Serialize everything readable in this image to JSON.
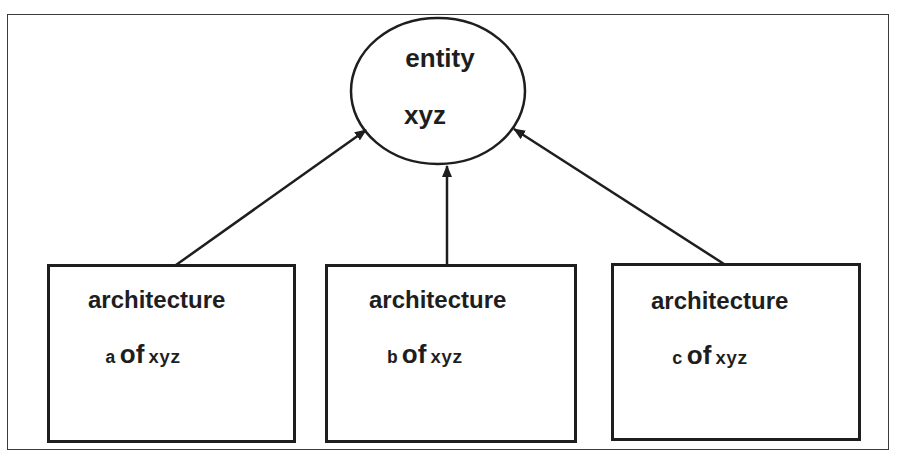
{
  "diagram": {
    "entity": {
      "title": "entity",
      "subtitle": "xyz"
    },
    "architectures": [
      {
        "title": "architecture",
        "letter": "a",
        "of": "of",
        "target": "xyz"
      },
      {
        "title": "architecture",
        "letter": "b",
        "of": "of",
        "target": "xyz"
      },
      {
        "title": "architecture",
        "letter": "c",
        "of": "of",
        "target": "xyz"
      }
    ],
    "edges": [
      {
        "from": "architecture a of xyz",
        "to": "entity xyz"
      },
      {
        "from": "architecture b of xyz",
        "to": "entity xyz"
      },
      {
        "from": "architecture c of xyz",
        "to": "entity xyz"
      }
    ],
    "colors": {
      "stroke": "#1e1e1e",
      "background": "#ffffff"
    }
  }
}
